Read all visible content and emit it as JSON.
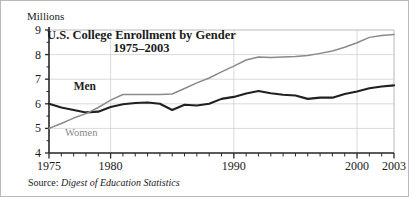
{
  "figure": {
    "unit_label": "Millions",
    "source_prefix": "Source:",
    "source_title": "Digest of Education Statistics"
  },
  "chart_data": {
    "type": "line",
    "title": "U.S. College Enrollment by Gender",
    "subtitle": "1975–2003",
    "xlabel": "",
    "ylabel": "Millions",
    "xlim": [
      1975,
      2003
    ],
    "ylim": [
      4,
      9
    ],
    "grid": true,
    "legend": "inline-labels",
    "y_ticks": [
      9,
      8,
      7,
      6,
      5,
      4
    ],
    "x_ticks": [
      1975,
      1980,
      1990,
      2000,
      2003
    ],
    "x_minor_tick_interval": 1,
    "x": [
      1975,
      1976,
      1977,
      1978,
      1979,
      1980,
      1981,
      1982,
      1983,
      1984,
      1985,
      1986,
      1987,
      1988,
      1989,
      1990,
      1991,
      1992,
      1993,
      1994,
      1995,
      1996,
      1997,
      1998,
      1999,
      2000,
      2001,
      2002,
      2003
    ],
    "series": [
      {
        "name": "Men",
        "color": "#231f20",
        "label_style": "bold",
        "label_x": 1977,
        "label_y": 6.55,
        "values": [
          6.0,
          5.85,
          5.75,
          5.65,
          5.68,
          5.87,
          5.98,
          6.03,
          6.05,
          6.0,
          5.75,
          5.96,
          5.93,
          6.0,
          6.2,
          6.28,
          6.42,
          6.52,
          6.43,
          6.37,
          6.34,
          6.2,
          6.25,
          6.25,
          6.4,
          6.5,
          6.63,
          6.7,
          6.75
        ]
      },
      {
        "name": "Women",
        "color": "#8a8a8a",
        "label_style": "regular",
        "label_x": 1976.3,
        "label_y": 4.68,
        "values": [
          5.0,
          5.2,
          5.42,
          5.6,
          5.85,
          6.15,
          6.38,
          6.38,
          6.38,
          6.38,
          6.4,
          6.62,
          6.85,
          7.05,
          7.3,
          7.53,
          7.78,
          7.9,
          7.88,
          7.9,
          7.92,
          7.96,
          8.05,
          8.15,
          8.3,
          8.48,
          8.7,
          8.78,
          8.82
        ]
      }
    ]
  }
}
